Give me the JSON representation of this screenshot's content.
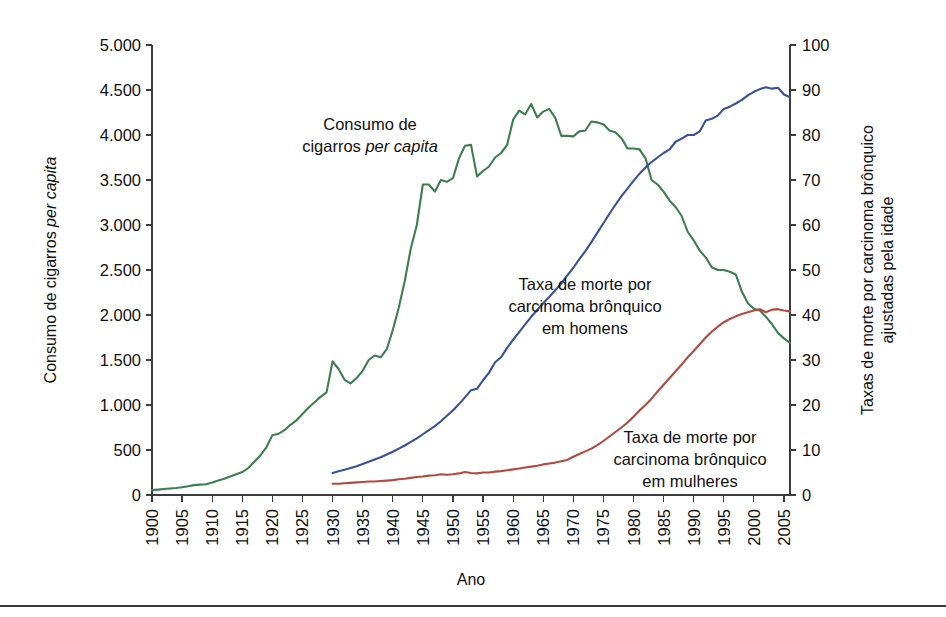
{
  "figure": {
    "background": "#ffffff",
    "plot": {
      "x0": 152,
      "x1": 790,
      "y0": 45,
      "y1": 495
    }
  },
  "axes": {
    "x": {
      "title": "Ano",
      "min": 1900,
      "max": 2006,
      "ticks": [
        1900,
        1905,
        1910,
        1915,
        1920,
        1925,
        1930,
        1935,
        1940,
        1945,
        1950,
        1955,
        1960,
        1965,
        1970,
        1975,
        1980,
        1985,
        1990,
        1995,
        2000,
        2005
      ],
      "tick_labels": [
        "1900",
        "1905",
        "1910",
        "1915",
        "1920",
        "1925",
        "1930",
        "1935",
        "1940",
        "1945",
        "1950",
        "1955",
        "1960",
        "1965",
        "1970",
        "1975",
        "1980",
        "1985",
        "1990",
        "1995",
        "2000",
        "2005"
      ],
      "label_rotation": -90
    },
    "y_left": {
      "title_plain": "Consumo de cigarros ",
      "title_italic": "per capita",
      "min": 0,
      "max": 5000,
      "ticks": [
        0,
        500,
        1000,
        1500,
        2000,
        2500,
        3000,
        3500,
        4000,
        4500,
        5000
      ],
      "tick_labels": [
        "0",
        "500",
        "1.000",
        "1.500",
        "2.000",
        "2.500",
        "3.000",
        "3.500",
        "4.000",
        "4.500",
        "5.000"
      ]
    },
    "y_right": {
      "title_line1": "Taxas de morte por carcinoma brônquico",
      "title_line2": "ajustadas pela idade",
      "min": 0,
      "max": 100,
      "ticks": [
        0,
        10,
        20,
        30,
        40,
        50,
        60,
        70,
        80,
        90,
        100
      ],
      "tick_labels": [
        "0",
        "10",
        "20",
        "30",
        "40",
        "50",
        "60",
        "70",
        "80",
        "90",
        "100"
      ]
    }
  },
  "annotations": [
    {
      "name": "annotation-cigarette-consumption",
      "x": 370,
      "y": 130,
      "anchor": "middle",
      "lines": [
        {
          "plain": "Consumo de",
          "italic": ""
        },
        {
          "plain": "cigarros ",
          "italic": "per capita"
        }
      ]
    },
    {
      "name": "annotation-male-death-rate",
      "x": 585,
      "y": 290,
      "anchor": "middle",
      "lines": [
        {
          "plain": "Taxa de morte por",
          "italic": ""
        },
        {
          "plain": "carcinoma brônquico",
          "italic": ""
        },
        {
          "plain": "em homens",
          "italic": ""
        }
      ]
    },
    {
      "name": "annotation-female-death-rate",
      "x": 690,
      "y": 443,
      "anchor": "middle",
      "lines": [
        {
          "plain": "Taxa de morte por",
          "italic": ""
        },
        {
          "plain": "carcinoma brônquico",
          "italic": ""
        },
        {
          "plain": "em mulheres",
          "italic": ""
        }
      ]
    }
  ],
  "chart_data": {
    "type": "line",
    "title": "",
    "xlabel": "Ano",
    "ylabel": "Consumo de cigarros per capita",
    "ylabel_right": "Taxas de morte por carcinoma brônquico ajustadas pela idade",
    "xlim": [
      1900,
      2006
    ],
    "ylim": [
      0,
      5000
    ],
    "ylim_right": [
      0,
      100
    ],
    "grid": false,
    "legend": "annotations-inline",
    "series": [
      {
        "name": "Consumo de cigarros per capita",
        "axis": "left",
        "color": "#3d7d52",
        "x": [
          1900,
          1901,
          1902,
          1903,
          1904,
          1905,
          1906,
          1907,
          1908,
          1909,
          1910,
          1911,
          1912,
          1913,
          1914,
          1915,
          1916,
          1917,
          1918,
          1919,
          1920,
          1921,
          1922,
          1923,
          1924,
          1925,
          1926,
          1927,
          1928,
          1929,
          1930,
          1931,
          1932,
          1933,
          1934,
          1935,
          1936,
          1937,
          1938,
          1939,
          1940,
          1941,
          1942,
          1943,
          1944,
          1945,
          1946,
          1947,
          1948,
          1949,
          1950,
          1951,
          1952,
          1953,
          1954,
          1955,
          1956,
          1957,
          1958,
          1959,
          1960,
          1961,
          1962,
          1963,
          1964,
          1965,
          1966,
          1967,
          1968,
          1969,
          1970,
          1971,
          1972,
          1973,
          1974,
          1975,
          1976,
          1977,
          1978,
          1979,
          1980,
          1981,
          1982,
          1983,
          1984,
          1985,
          1986,
          1987,
          1988,
          1989,
          1990,
          1991,
          1992,
          1993,
          1994,
          1995,
          1996,
          1997,
          1998,
          1999,
          2000,
          2001,
          2002,
          2003,
          2004,
          2005,
          2006
        ],
        "y": [
          54,
          60,
          66,
          72,
          78,
          86,
          98,
          110,
          115,
          120,
          138,
          160,
          180,
          205,
          230,
          255,
          300,
          370,
          440,
          530,
          665,
          680,
          720,
          780,
          830,
          900,
          970,
          1030,
          1090,
          1140,
          1485,
          1400,
          1280,
          1240,
          1300,
          1380,
          1500,
          1550,
          1530,
          1620,
          1830,
          2080,
          2380,
          2740,
          3000,
          3450,
          3450,
          3370,
          3500,
          3480,
          3520,
          3740,
          3880,
          3890,
          3540,
          3600,
          3650,
          3750,
          3800,
          3890,
          4170,
          4270,
          4230,
          4345,
          4195,
          4260,
          4290,
          4190,
          3990,
          3990,
          3985,
          4040,
          4050,
          4150,
          4140,
          4120,
          4050,
          4030,
          3965,
          3850,
          3850,
          3840,
          3740,
          3500,
          3450,
          3370,
          3270,
          3200,
          3100,
          2925,
          2830,
          2715,
          2640,
          2530,
          2500,
          2500,
          2480,
          2450,
          2260,
          2130,
          2070,
          2050,
          1980,
          1900,
          1800,
          1740,
          1690
        ]
      },
      {
        "name": "Taxa de morte por carcinoma brônquico em homens",
        "axis": "right",
        "color": "#3a4f9e",
        "x": [
          1930,
          1931,
          1932,
          1933,
          1934,
          1935,
          1936,
          1937,
          1938,
          1939,
          1940,
          1941,
          1942,
          1943,
          1944,
          1945,
          1946,
          1947,
          1948,
          1949,
          1950,
          1951,
          1952,
          1953,
          1954,
          1955,
          1956,
          1957,
          1958,
          1959,
          1960,
          1961,
          1962,
          1963,
          1964,
          1965,
          1966,
          1967,
          1968,
          1969,
          1970,
          1971,
          1972,
          1973,
          1974,
          1975,
          1976,
          1977,
          1978,
          1979,
          1980,
          1981,
          1982,
          1983,
          1984,
          1985,
          1986,
          1987,
          1988,
          1989,
          1990,
          1991,
          1992,
          1993,
          1994,
          1995,
          1996,
          1997,
          1998,
          1999,
          2000,
          2001,
          2002,
          2003,
          2004,
          2005,
          2006
        ],
        "y": [
          4.9,
          5.3,
          5.6,
          6.0,
          6.4,
          6.9,
          7.4,
          7.9,
          8.4,
          9.0,
          9.6,
          10.3,
          11.0,
          11.8,
          12.6,
          13.5,
          14.4,
          15.3,
          16.4,
          17.6,
          18.8,
          20.2,
          21.7,
          23.3,
          23.6,
          25.5,
          27.2,
          29.5,
          30.6,
          32.7,
          34.5,
          36.2,
          37.9,
          39.6,
          41.1,
          42.6,
          44.0,
          45.5,
          47.0,
          48.8,
          50.5,
          52.4,
          54.2,
          56.2,
          58.3,
          60.4,
          62.5,
          64.5,
          66.4,
          68.1,
          69.8,
          71.4,
          72.8,
          74.0,
          75.0,
          76.0,
          76.8,
          78.5,
          79.2,
          80.0,
          80.0,
          80.8,
          83.2,
          83.6,
          84.3,
          85.8,
          86.3,
          87.0,
          87.8,
          88.8,
          89.6,
          90.2,
          90.6,
          90.3,
          90.5,
          89.0,
          88.4
        ]
      },
      {
        "name": "Taxa de morte por carcinoma brônquico em mulheres",
        "axis": "right",
        "color": "#b5483f",
        "x": [
          1930,
          1931,
          1932,
          1933,
          1934,
          1935,
          1936,
          1937,
          1938,
          1939,
          1940,
          1941,
          1942,
          1943,
          1944,
          1945,
          1946,
          1947,
          1948,
          1949,
          1950,
          1951,
          1952,
          1953,
          1954,
          1955,
          1956,
          1957,
          1958,
          1959,
          1960,
          1961,
          1962,
          1963,
          1964,
          1965,
          1966,
          1967,
          1968,
          1969,
          1970,
          1971,
          1972,
          1973,
          1974,
          1975,
          1976,
          1977,
          1978,
          1979,
          1980,
          1981,
          1982,
          1983,
          1984,
          1985,
          1986,
          1987,
          1988,
          1989,
          1990,
          1991,
          1992,
          1993,
          1994,
          1995,
          1996,
          1997,
          1998,
          1999,
          2000,
          2001,
          2002,
          2003,
          2004,
          2005,
          2006
        ],
        "y": [
          2.5,
          2.5,
          2.6,
          2.7,
          2.8,
          2.9,
          3.0,
          3.0,
          3.1,
          3.2,
          3.3,
          3.5,
          3.6,
          3.8,
          4.0,
          4.1,
          4.3,
          4.4,
          4.6,
          4.5,
          4.6,
          4.8,
          5.1,
          4.9,
          4.8,
          5.0,
          5.0,
          5.2,
          5.3,
          5.5,
          5.7,
          5.9,
          6.1,
          6.3,
          6.5,
          6.8,
          7.0,
          7.2,
          7.5,
          7.8,
          8.5,
          9.1,
          9.7,
          10.3,
          11.1,
          12.0,
          13.0,
          14.0,
          15.0,
          16.1,
          17.4,
          18.8,
          20.0,
          21.4,
          23.0,
          24.5,
          26.0,
          27.5,
          29.0,
          30.6,
          32.0,
          33.5,
          35.0,
          36.3,
          37.4,
          38.4,
          39.1,
          39.7,
          40.2,
          40.6,
          41.0,
          41.3,
          40.6,
          41.2,
          41.3,
          41.0,
          40.8
        ]
      }
    ]
  }
}
